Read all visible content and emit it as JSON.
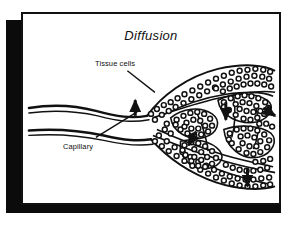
{
  "figure": {
    "title": "Diffusion",
    "kind": "biology-diagram",
    "panel": {
      "background_color": "#ffffff",
      "border_color": "#111111",
      "shadow_color": "#0b0b0b"
    },
    "ink_color": "#111111"
  },
  "labels": [
    {
      "id": "tissue-cells",
      "text": "Tissue cells"
    },
    {
      "id": "capillary",
      "text": "Capillary"
    }
  ],
  "annotations": {
    "leader_lines": 2,
    "diffusion_arrows": 5,
    "arrow_description": "solid black arrows showing diffusion from capillary into surrounding tissue"
  },
  "structures": [
    {
      "id": "capillary-inflow",
      "text": "capillary vessels entering from left"
    },
    {
      "id": "tissue-lobes",
      "text": "lobes of tissue cells drawn as clustered small circles"
    },
    {
      "id": "capillary-network",
      "text": "branching capillary network within tissue"
    }
  ]
}
